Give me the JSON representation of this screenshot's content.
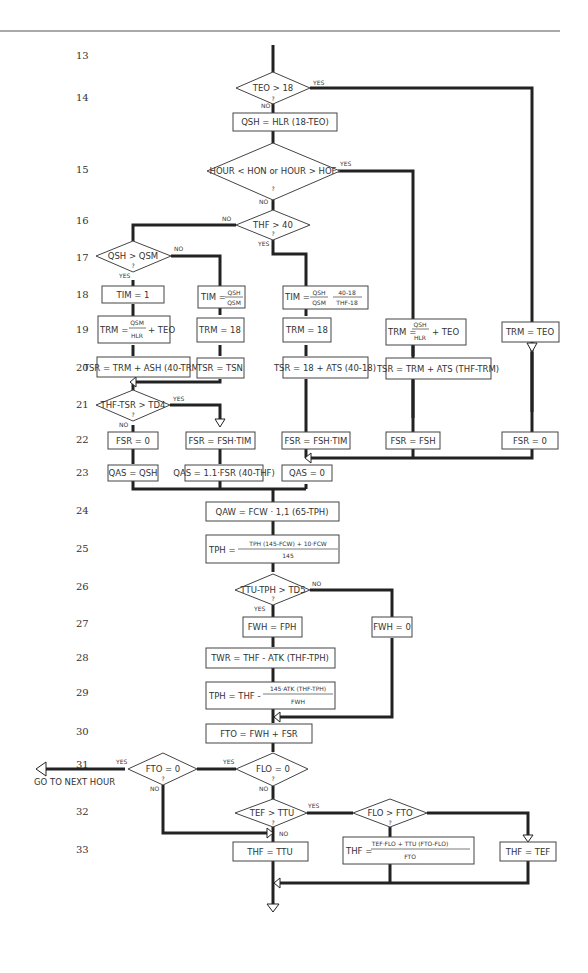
{
  "diagram": {
    "type": "flowchart",
    "steps": [
      {
        "n": "13",
        "y": 56
      },
      {
        "n": "14",
        "y": 98
      },
      {
        "n": "15",
        "y": 170
      },
      {
        "n": "16",
        "y": 221
      },
      {
        "n": "17",
        "y": 258
      },
      {
        "n": "18",
        "y": 295
      },
      {
        "n": "19",
        "y": 330
      },
      {
        "n": "20",
        "y": 368
      },
      {
        "n": "21",
        "y": 405
      },
      {
        "n": "22",
        "y": 440
      },
      {
        "n": "23",
        "y": 473
      },
      {
        "n": "24",
        "y": 511
      },
      {
        "n": "25",
        "y": 549
      },
      {
        "n": "26",
        "y": 587
      },
      {
        "n": "27",
        "y": 624
      },
      {
        "n": "28",
        "y": 658
      },
      {
        "n": "29",
        "y": 693
      },
      {
        "n": "30",
        "y": 732
      },
      {
        "n": "31",
        "y": 765
      },
      {
        "n": "32",
        "y": 812
      },
      {
        "n": "33",
        "y": 850
      }
    ],
    "labels": {
      "yes": "YES",
      "no": "NO",
      "q": "?",
      "go_next_hour": "GO TO NEXT HOUR"
    },
    "decisions": {
      "d13": "TEO > 18",
      "d15": "HOUR < HON or HOUR > HOF",
      "d16": "THF > 40",
      "d17": "QSH > QSM",
      "d21": "THF-TSR > TD4",
      "d26": "TTU-TPH > TD5",
      "d31a": "FTO = 0",
      "d31b": "FLO = 0",
      "d32a": "TEF > TTU",
      "d32b": "FLO > FTO"
    },
    "boxes": {
      "b14": "QSH = HLR (18-TEO)",
      "b18a": "TIM = 1",
      "b18b_lhs": "TIM =",
      "b18b_num": "QSH",
      "b18b_den": "QSM",
      "b18c_lhs": "TIM =",
      "b18c_num": "QSH",
      "b18c_den": "QSM",
      "b18c_pnum": "40-18",
      "b18c_pden": "THF-18",
      "b19a_lhs": "TRM =",
      "b19a_num": "QSM",
      "b19a_den": "HLR",
      "b19a_rhs": "+ TEO",
      "b19b": "TRM = 18",
      "b19c": "TRM = 18",
      "b19d_lhs": "TRM =",
      "b19d_num": "QSH",
      "b19d_den": "HLR",
      "b19d_rhs": "+ TEO",
      "b19e": "TRM = TEO",
      "b20a": "TSR = TRM + ASH (40-TRM)",
      "b20b": "TSR = TSN",
      "b20c": "TSR = 18 + ATS (40-18)",
      "b20d": "TSR = TRM + ATS (THF-TRM)",
      "b22a": "FSR = 0",
      "b22b": "FSR = FSH·TIM",
      "b22c": "FSR = FSH·TIM",
      "b22d": "FSR = FSH",
      "b22e": "FSR = 0",
      "b23a": "QAS = QSH",
      "b23b": "QAS = 1.1·FSR (40-THF)",
      "b23c": "QAS = 0",
      "b24": "QAW = FCW · 1,1 (65-TPH)",
      "b25_lhs": "TPH =",
      "b25_num": "TPH (145-FCW) + 10·FCW",
      "b25_den": "145",
      "b27a": "FWH = FPH",
      "b27b": "FWH = 0",
      "b28": "TWR = THF - ATK (THF-TPH)",
      "b29_lhs": "TPH = THF -",
      "b29_num": "145·ATK (THF-TPH)",
      "b29_den": "FWH",
      "b30": "FTO = FWH + FSR",
      "b33a": "THF = TTU",
      "b33b_lhs": "THF =",
      "b33b_num": "TEF·FLO + TTU (FTO-FLO)",
      "b33b_den": "FTO",
      "b33c": "THF = TEF"
    }
  }
}
